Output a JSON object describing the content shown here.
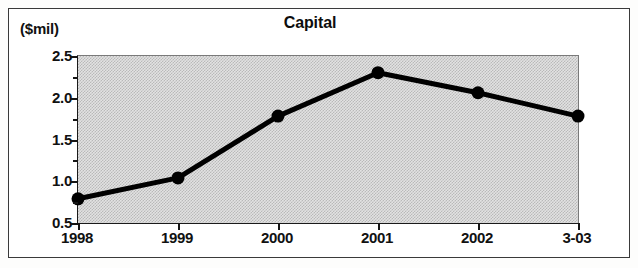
{
  "figure": {
    "y_unit_label": "($mil)",
    "title": "Capital"
  },
  "chart_data": {
    "type": "line",
    "title": "Capital",
    "xlabel": "",
    "ylabel": "($mil)",
    "y_unit": "$mil",
    "categories": [
      "1998",
      "1999",
      "2000",
      "2001",
      "2002",
      "3-03"
    ],
    "values": [
      0.79,
      1.04,
      1.78,
      2.3,
      2.06,
      1.78
    ],
    "series": [
      {
        "name": "Capital",
        "values": [
          0.79,
          1.04,
          1.78,
          2.3,
          2.06,
          1.78
        ]
      }
    ],
    "ylim": [
      0.5,
      2.5
    ],
    "ytick_labels": [
      "0.5",
      "1.0",
      "1.5",
      "2.0",
      "2.5"
    ],
    "ytick_values": [
      0.5,
      1.0,
      1.5,
      2.0,
      2.5
    ],
    "yminor_step": 0.25,
    "grid": false,
    "legend": "none",
    "marker": "filled-circle",
    "line_color": "#000000",
    "plot_background": "#d9d9d9"
  }
}
